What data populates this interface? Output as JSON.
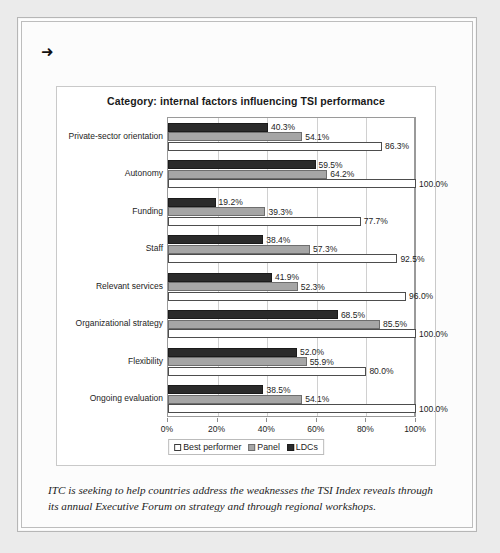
{
  "document": {
    "bullet_icon": "➜",
    "caption": "ITC is seeking to help countries address the weaknesses the TSI Index reveals through its annual Executive Forum on strategy and through regional workshops."
  },
  "colors": {
    "ldcs": "#2b2b2b",
    "panel": "#a6a6a6",
    "best_performer": "#ffffff",
    "page_background": "#ebebeb",
    "gridline": "#d0d0d0"
  },
  "legend": {
    "best_label": "Best performer",
    "panel_label": "Panel",
    "ldcs_label": "LDCs"
  },
  "chart_data": {
    "type": "bar",
    "orientation": "horizontal",
    "title": "Category: internal factors influencing TSI performance",
    "xlabel": "",
    "ylabel": "",
    "xlim": [
      0,
      100
    ],
    "grid": true,
    "legend_position": "bottom",
    "tick_labels": [
      "0%",
      "20%",
      "40%",
      "60%",
      "80%",
      "100%"
    ],
    "ticks": [
      0,
      20,
      40,
      60,
      80,
      100
    ],
    "categories": [
      "Private-sector orientation",
      "Autonomy",
      "Funding",
      "Staff",
      "Relevant services",
      "Organizational strategy",
      "Flexibility",
      "Ongoing evaluation"
    ],
    "series": [
      {
        "name": "LDCs",
        "values": [
          40.3,
          59.5,
          19.2,
          38.4,
          41.9,
          68.5,
          52.0,
          38.5
        ],
        "labels": [
          "40.3%",
          "59.5%",
          "19.2%",
          "38.4%",
          "41.9%",
          "68.5%",
          "52.0%",
          "38.5%"
        ]
      },
      {
        "name": "Panel",
        "values": [
          54.1,
          64.2,
          39.3,
          57.3,
          52.3,
          85.5,
          55.9,
          54.1
        ],
        "labels": [
          "54.1%",
          "64.2%",
          "39.3%",
          "57.3%",
          "52.3%",
          "85.5%",
          "55.9%",
          "54.1%"
        ]
      },
      {
        "name": "Best performer",
        "values": [
          86.3,
          100.0,
          77.7,
          92.5,
          96.0,
          100.0,
          80.0,
          100.0
        ],
        "labels": [
          "86.3%",
          "100.0%",
          "77.7%",
          "92.5%",
          "96.0%",
          "100.0%",
          "80.0%",
          "100.0%"
        ]
      }
    ]
  }
}
